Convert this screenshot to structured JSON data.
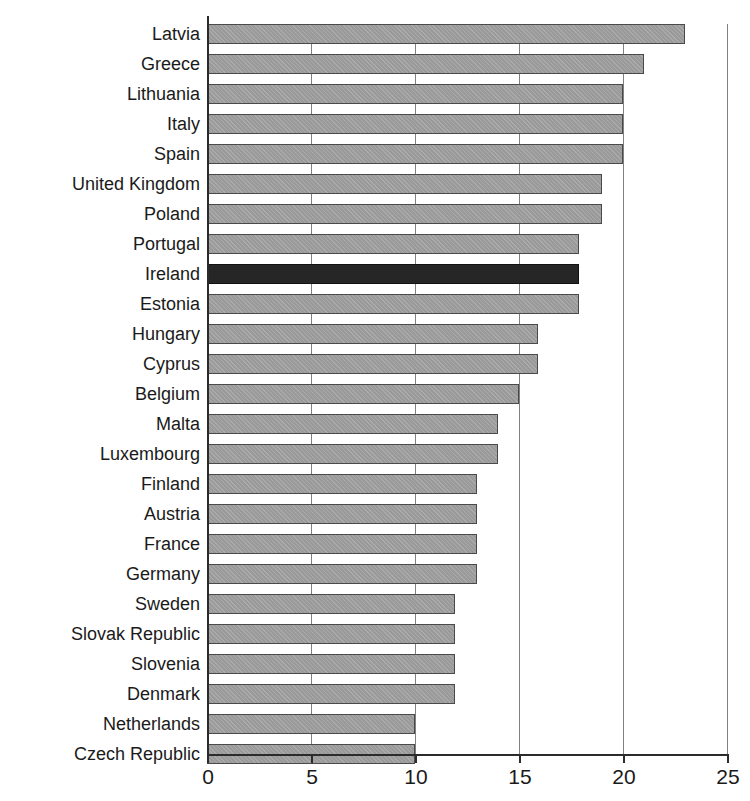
{
  "chart_data": {
    "type": "bar",
    "orientation": "horizontal",
    "title": "",
    "subtitle": "",
    "xlabel": "",
    "ylabel": "",
    "xlim": [
      0,
      25
    ],
    "xticks": [
      0,
      5,
      10,
      15,
      20,
      25
    ],
    "xtick_labels": [
      "0",
      "5",
      "10",
      "15",
      "20",
      "25"
    ],
    "grid": true,
    "grid_axis": "x",
    "legend": null,
    "categories": [
      "Latvia",
      "Greece",
      "Lithuania",
      "Italy",
      "Spain",
      "United Kingdom",
      "Poland",
      "Portugal",
      "Ireland",
      "Estonia",
      "Hungary",
      "Cyprus",
      "Belgium",
      "Malta",
      "Luxembourg",
      "Finland",
      "Austria",
      "France",
      "Germany",
      "Sweden",
      "Slovak Republic",
      "Slovenia",
      "Denmark",
      "Netherlands",
      "Czech Republic"
    ],
    "values": [
      23.0,
      21.0,
      20.0,
      20.0,
      20.0,
      19.0,
      19.0,
      17.9,
      17.9,
      17.9,
      15.9,
      15.9,
      15.0,
      14.0,
      14.0,
      13.0,
      13.0,
      13.0,
      13.0,
      11.9,
      11.9,
      11.9,
      11.9,
      10.0,
      10.0
    ],
    "highlight_category": "Ireland",
    "colors": {
      "bar_fill": "#9a9a9a",
      "bar_border": "#4a4a4a",
      "highlight_fill": "#262626",
      "highlight_border": "#111111",
      "axis": "#2b2b2b",
      "gridline": "#808080",
      "text": "#1a1a1a",
      "background": "#ffffff"
    }
  }
}
